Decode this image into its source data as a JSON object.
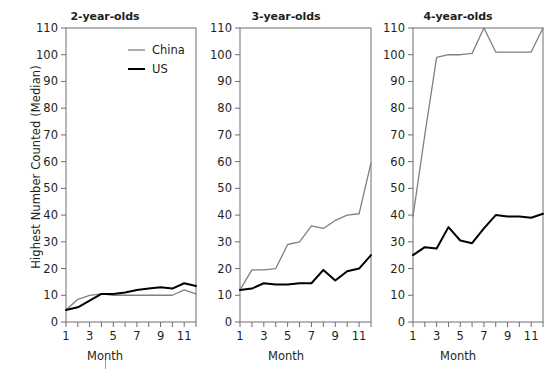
{
  "figure": {
    "ylabel": "Highest Number Counted (Median)",
    "xlabel": "Month",
    "panel_titles": [
      "2-year-olds",
      "3-year-olds",
      "4-year-olds"
    ],
    "y_ticks": [
      "0",
      "10",
      "20",
      "30",
      "40",
      "50",
      "60",
      "70",
      "80",
      "90",
      "100",
      "110"
    ],
    "x_ticks": [
      "1",
      "3",
      "5",
      "7",
      "9",
      "11"
    ],
    "legend": [
      {
        "label": "China",
        "color": "#808080"
      },
      {
        "label": "US",
        "color": "#000000"
      }
    ]
  },
  "chart_data": [
    {
      "type": "line",
      "title": "2-year-olds",
      "xlabel": "Month",
      "ylabel": "Highest Number Counted (Median)",
      "x": [
        1,
        2,
        3,
        4,
        5,
        6,
        7,
        8,
        9,
        10,
        11,
        12
      ],
      "xlim": [
        1,
        12
      ],
      "ylim": [
        0,
        110
      ],
      "ytick_step": 10,
      "grid": false,
      "legend_position": "top-right",
      "series": [
        {
          "name": "China",
          "color": "#808080",
          "values": [
            4.5,
            8.5,
            10,
            10.5,
            10,
            10,
            10,
            10,
            10,
            10,
            12,
            10.5
          ]
        },
        {
          "name": "US",
          "color": "#000000",
          "values": [
            4.5,
            5.5,
            8,
            10.5,
            10.5,
            11,
            12,
            12.5,
            13,
            12.5,
            14.5,
            13.5
          ]
        }
      ]
    },
    {
      "type": "line",
      "title": "3-year-olds",
      "xlabel": "Month",
      "ylabel": "Highest Number Counted (Median)",
      "x": [
        1,
        2,
        3,
        4,
        5,
        6,
        7,
        8,
        9,
        10,
        11,
        12
      ],
      "xlim": [
        1,
        12
      ],
      "ylim": [
        0,
        110
      ],
      "ytick_step": 10,
      "grid": false,
      "legend_position": "none",
      "series": [
        {
          "name": "China",
          "color": "#808080",
          "values": [
            12,
            19.5,
            19.5,
            20,
            29,
            30,
            36,
            35,
            38,
            40,
            40.5,
            59.5
          ]
        },
        {
          "name": "US",
          "color": "#000000",
          "values": [
            12,
            12.5,
            14.5,
            14,
            14,
            14.5,
            14.5,
            19.5,
            15.5,
            19,
            20,
            25
          ]
        }
      ]
    },
    {
      "type": "line",
      "title": "4-year-olds",
      "xlabel": "Month",
      "ylabel": "Highest Number Counted (Median)",
      "x": [
        1,
        2,
        3,
        4,
        5,
        6,
        7,
        8,
        9,
        10,
        11,
        12
      ],
      "xlim": [
        1,
        12
      ],
      "ylim": [
        0,
        110
      ],
      "ytick_step": 10,
      "grid": false,
      "legend_position": "none",
      "series": [
        {
          "name": "China",
          "color": "#808080",
          "values": [
            39.5,
            70,
            99,
            100,
            100,
            100.5,
            110,
            101,
            101,
            101,
            101,
            110
          ]
        },
        {
          "name": "US",
          "color": "#000000",
          "values": [
            25,
            28,
            27.5,
            35.5,
            30.5,
            29.5,
            35,
            40,
            39.5,
            39.5,
            39,
            40.5
          ]
        }
      ]
    }
  ]
}
